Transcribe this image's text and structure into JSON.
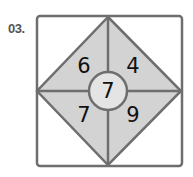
{
  "problem": {
    "label": "03.",
    "top_left": "6",
    "top_right": "4",
    "center": "7",
    "bottom_left": "7",
    "bottom_right": "9"
  },
  "colors": {
    "fill": "#d3d3d3",
    "stroke": "#6e6e6e",
    "circle_fill": "#e4e4e4"
  }
}
